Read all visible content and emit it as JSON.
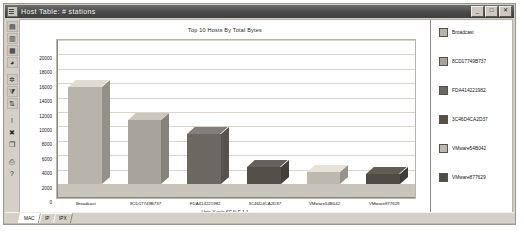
{
  "window": {
    "title": "Host Table: # stations",
    "icon": "window-document-icon",
    "buttons": {
      "minimize": "_",
      "maximize": "□",
      "close": "✕"
    }
  },
  "toolbar": {
    "items": [
      {
        "name": "table-view-icon",
        "glyph": "▤"
      },
      {
        "name": "chart-bar-icon",
        "glyph": "▥"
      },
      {
        "name": "chart-column-icon",
        "glyph": "▦"
      },
      {
        "name": "chart-pie-icon",
        "glyph": "◕"
      },
      {
        "name": "settings-icon",
        "glyph": "✲"
      },
      {
        "name": "filter-icon",
        "glyph": "⧩"
      },
      {
        "name": "sort-icon",
        "glyph": "⇅"
      },
      {
        "name": "alarm-icon",
        "glyph": "!"
      },
      {
        "name": "delete-icon",
        "glyph": "✖"
      },
      {
        "name": "copy-icon",
        "glyph": "❐"
      },
      {
        "name": "print-icon",
        "glyph": "⎙"
      },
      {
        "name": "help-icon",
        "glyph": "?"
      }
    ]
  },
  "chart_data": {
    "type": "bar",
    "title": "Top 10 Hosts By Total Bytes",
    "xlabel": "",
    "ylabel": "",
    "unit_note": "Unit: Y-axis SCALE 1:1",
    "categories": [
      "Broadcast",
      "8CD17749B737",
      "FDA414221982",
      "3C46D4CA2D37",
      "VMware54B042",
      "VMware877629"
    ],
    "values": [
      13500,
      8900,
      6900,
      2400,
      1700,
      1400
    ],
    "ylim": [
      0,
      20000
    ],
    "yticks": [
      0,
      2000,
      4000,
      6000,
      8000,
      10000,
      12000,
      14000,
      16000,
      18000,
      20000
    ],
    "grid": true,
    "legend_position": "right",
    "series_colors": [
      "#b8b4ac",
      "#a8a49c",
      "#6b6862",
      "#545049",
      "#bdb9b1",
      "#4f4c46"
    ],
    "legend": [
      "Broadcast",
      "8CD17749B737",
      "FDA414221982",
      "3C46D4CA2D37",
      "VMware54B042",
      "VMware877629"
    ]
  },
  "tabs": [
    {
      "label": "MAC",
      "active": true
    },
    {
      "label": "IP",
      "active": false
    },
    {
      "label": "IPX",
      "active": false
    }
  ]
}
